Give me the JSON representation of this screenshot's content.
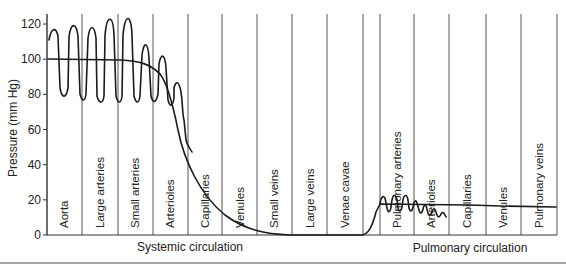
{
  "chart_data": {
    "type": "line",
    "title": "",
    "xlabel": "",
    "ylabel": "Pressure (mm Hg)",
    "ylim": [
      0,
      120
    ],
    "yticks": [
      0,
      20,
      40,
      60,
      80,
      100,
      120
    ],
    "grid": false,
    "legend": null,
    "categories": [
      "Aorta",
      "Large arteries",
      "Small arteries",
      "Arterioles",
      "Capillaries",
      "Venules",
      "Small veins",
      "Large veins",
      "Venae cavae",
      "Pulmonary arteries",
      "Arterioles",
      "Capillaries",
      "Venules",
      "Pulmonary veins"
    ],
    "groups": [
      {
        "name": "Systemic circulation",
        "segments": [
          "Aorta",
          "Large arteries",
          "Small arteries",
          "Arterioles",
          "Capillaries",
          "Venules",
          "Small veins",
          "Large veins",
          "Venae cavae"
        ]
      },
      {
        "name": "Pulmonary circulation",
        "segments": [
          "Pulmonary arteries",
          "Arterioles",
          "Capillaries",
          "Venules",
          "Pulmonary veins"
        ]
      }
    ],
    "series": [
      {
        "name": "Mean pressure",
        "values": [
          100,
          99,
          96,
          60,
          25,
          12,
          2,
          1,
          0,
          16,
          10,
          5,
          3,
          2
        ]
      },
      {
        "name": "Pulsatile pressure (systolic/diastolic)",
        "systolic": [
          116,
          121,
          107,
          84,
          null,
          null,
          null,
          null,
          null,
          23,
          15,
          null,
          null,
          null
        ],
        "diastolic": [
          80,
          78,
          82,
          70,
          null,
          null,
          null,
          null,
          null,
          12,
          8,
          null,
          null,
          null
        ]
      }
    ]
  },
  "layout": {
    "plot": {
      "x0": 47,
      "x1": 557,
      "y0": 235,
      "ytop": 14,
      "px_per_unit": 1.758
    },
    "dividers_x": [
      47,
      82,
      118,
      153,
      188,
      222,
      257,
      292,
      327,
      363,
      380,
      414,
      449,
      486,
      521,
      557
    ],
    "segments_px": [
      {
        "label": "Aorta",
        "x": 64
      },
      {
        "label": "Large arteries",
        "x": 100
      },
      {
        "label": "Small arteries",
        "x": 135
      },
      {
        "label": "Arterioles",
        "x": 170
      },
      {
        "label": "Capillaries",
        "x": 205
      },
      {
        "label": "Venules",
        "x": 240
      },
      {
        "label": "Small veins",
        "x": 274
      },
      {
        "label": "Large veins",
        "x": 310
      },
      {
        "label": "Venae cavae",
        "x": 345
      },
      {
        "label": "Pulmonary arteries",
        "x": 397
      },
      {
        "label": "Arterioles",
        "x": 431
      },
      {
        "label": "Capillaries",
        "x": 467
      },
      {
        "label": "Venules",
        "x": 503
      },
      {
        "label": "Pulmonary veins",
        "x": 539
      }
    ],
    "group_labels": [
      {
        "label": "Systemic circulation",
        "x": 190,
        "y": 251
      },
      {
        "label": "Pulmonary circulation",
        "x": 470,
        "y": 252
      }
    ],
    "mean_path": "M48,59 L120,60 C140,61 150,64 160,74 C168,84 174,110 178,130 C184,160 200,195 225,215 C245,230 265,234 290,235 L362,235 C368,234 372,228 376,212 L380,204 L470,205 L500,206 L556,207",
    "pulse_path": "M49,40 C51,28 56,26 58,36 L60,88 C62,99 66,99 68,88 L69,37 C71,22 76,22 78,36 L80,94 C82,102 85,102 86,94 L88,38 C90,24 94,24 96,38 L97,96 C99,104 103,104 104,96 L105,35 C107,14 113,14 114,35 L116,96 C118,104 121,104 122,96 L123,35 C125,14 131,12 132,35 L134,96 C136,104 139,104 140,96 L142,55 C144,40 148,42 149,58 L151,96 C153,104 156,103 158,94 L159,64 C161,52 165,54 166,68 L168,100 C170,108 173,106 174,98 L174,88 C176,80 179,81 181,92 C183,104 182,112 184,120 L186,140 C188,148 190,148 192,152",
    "pulm_pulse_path": "M380,204 C381,197 383,195 385,198 L387,208 C388,213 390,213 391,207 L392,200 C393,194 396,194 397,200 L398,208 C399,212 401,212 402,207 L403,200 C404,194 407,194 408,200 L409,208 C410,212 412,212 413,207 C414,201 416,199 417,203 L419,210 C420,214 422,214 423,209 C424,204 426,204 427,209 L428,213 C429,216 431,216 432,212 C433,208 435,208 436,212 L437,215 C438,218 440,217 441,214 C442,212 444,212 445,215 L446,217"
  },
  "separator": {
    "y": 263
  }
}
